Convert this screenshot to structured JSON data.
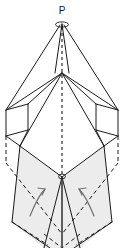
{
  "figure": {
    "canvas": {
      "width": 124,
      "height": 248
    },
    "labels": [
      {
        "id": "apex",
        "text": "P",
        "x": 62,
        "y": 13
      }
    ],
    "colors": {
      "stroke": "#1a1a1a",
      "stroke_light": "#555555",
      "shade_fill": "#e9e9e9",
      "background": "#ffffff",
      "arrow": "#6b6b6b"
    },
    "geometry": {
      "apex": {
        "x": 62,
        "y": 24
      },
      "upper_shoulder": {
        "x": 62,
        "y": 73
      },
      "lower_vertex": {
        "x": 62,
        "y": 177
      },
      "left_waist_top": {
        "x": 6,
        "y": 110
      },
      "right_waist_top": {
        "x": 118,
        "y": 110
      },
      "left_waist_bottom": {
        "x": 6,
        "y": 136
      },
      "right_waist_bottom": {
        "x": 118,
        "y": 136
      },
      "bottom_tip": {
        "x": 62,
        "y": 248
      }
    },
    "arrows": [
      {
        "id": "left-rotation-arrow",
        "cx": 38,
        "cy": 198,
        "direction": "counter-clockwise"
      },
      {
        "id": "right-rotation-arrow",
        "cx": 86,
        "cy": 198,
        "direction": "clockwise"
      }
    ],
    "line_styles": {
      "solid": "solid-edge",
      "dashed": "hidden-edge",
      "axis": "dashed-symmetry-axis"
    }
  }
}
